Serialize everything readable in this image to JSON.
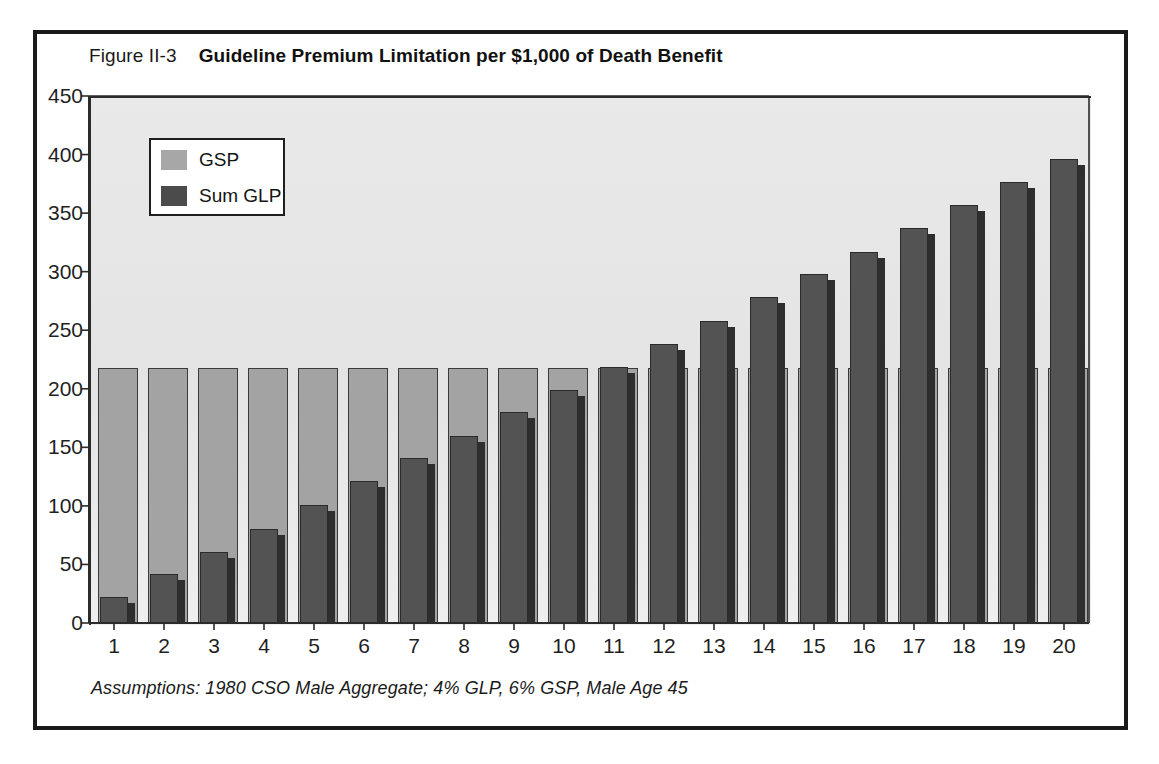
{
  "figure": {
    "number_label": "Figure II-3",
    "title": "Guideline Premium Limitation per $1,000 of Death Benefit",
    "footnote": "Assumptions: 1980 CSO Male Aggregate; 4% GLP, 6% GSP, Male Age 45"
  },
  "colors": {
    "gsp_fill": "#a3a3a3",
    "glp_fill": "#535353",
    "plot_background": "#e6e6e6",
    "frame": "#1a1a1a",
    "axis": "#2b2b2b"
  },
  "legend": {
    "position": "top-left-inside",
    "entries": [
      {
        "label": "GSP",
        "swatch": "gsp"
      },
      {
        "label": "Sum GLP",
        "swatch": "glp"
      }
    ]
  },
  "chart_data": {
    "type": "bar",
    "title": "Guideline Premium Limitation per $1,000 of Death Benefit",
    "subtitle": "Figure II-3",
    "annotation": "Assumptions: 1980 CSO Male Aggregate; 4% GLP, 6% GSP, Male Age 45",
    "xlabel": "",
    "ylabel": "",
    "grid": false,
    "legend_position": "upper left",
    "ylim": [
      0,
      450
    ],
    "ytick_values": [
      0,
      50,
      100,
      150,
      200,
      250,
      300,
      350,
      400,
      450
    ],
    "ytick_labels": [
      "0",
      "50",
      "100",
      "150",
      "200",
      "250",
      "300",
      "350",
      "400",
      "450"
    ],
    "categories": [
      "1",
      "2",
      "3",
      "4",
      "5",
      "6",
      "7",
      "8",
      "9",
      "10",
      "11",
      "12",
      "13",
      "14",
      "15",
      "16",
      "17",
      "18",
      "19",
      "20"
    ],
    "xtick_labels": [
      "1",
      "2",
      "3",
      "4",
      "5",
      "6",
      "7",
      "8",
      "9",
      "10",
      "11",
      "12",
      "13",
      "14",
      "15",
      "16",
      "17",
      "18",
      "19",
      "20"
    ],
    "series": [
      {
        "name": "GSP",
        "color": "#a3a3a3",
        "values": [
          218,
          218,
          218,
          218,
          218,
          218,
          218,
          218,
          218,
          218,
          218,
          218,
          218,
          218,
          218,
          218,
          218,
          218,
          218,
          218
        ]
      },
      {
        "name": "Sum GLP",
        "color": "#535353",
        "values": [
          22,
          42,
          61,
          80,
          101,
          121,
          141,
          160,
          180,
          199,
          219,
          238,
          258,
          278,
          298,
          317,
          337,
          357,
          377,
          396
        ]
      }
    ]
  }
}
